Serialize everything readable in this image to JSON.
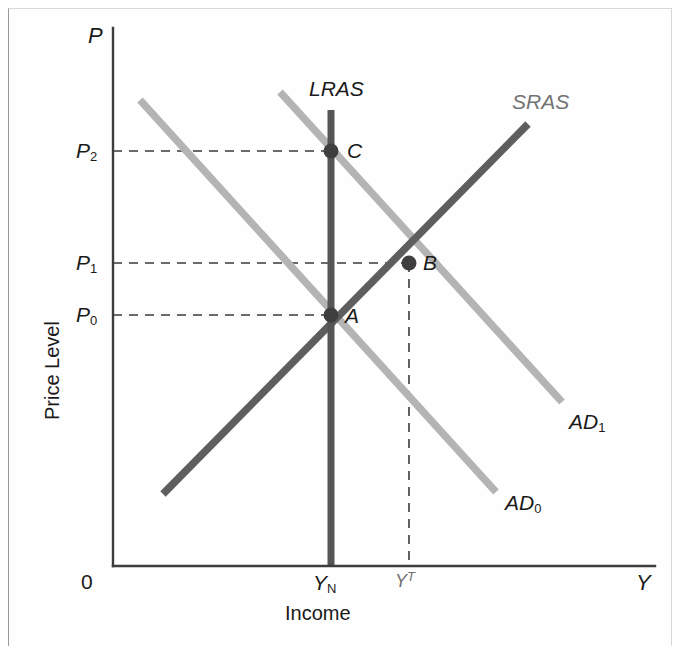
{
  "figure": {
    "kind": "ad-as-macroeconomic-diagram",
    "background": "#fefefe",
    "width": 680,
    "height": 649
  },
  "axes": {
    "y_symbol": "P",
    "y_title": "Price Level",
    "x_symbol": "Y",
    "x_title": "Income",
    "origin_label": "0",
    "y_ticks": [
      {
        "label": "P",
        "sub": "2",
        "y": 151
      },
      {
        "label": "P",
        "sub": "1",
        "y": 263
      },
      {
        "label": "P",
        "sub": "0",
        "y": 315
      }
    ],
    "x_ticks": [
      {
        "label": "Y",
        "sub": "N",
        "x": 331
      },
      {
        "label": "Y",
        "sup": "T",
        "x": 409
      }
    ]
  },
  "curves": [
    {
      "name": "AD0",
      "label": "AD",
      "sub": "0",
      "color": "#b4b4b4",
      "x1": 140,
      "y1": 100,
      "x2": 496,
      "y2": 492,
      "label_x": 505,
      "label_y": 492
    },
    {
      "name": "AD1",
      "label": "AD",
      "sub": "1",
      "color": "#b4b4b4",
      "x1": 280,
      "y1": 92,
      "x2": 562,
      "y2": 402,
      "label_x": 569,
      "label_y": 411
    },
    {
      "name": "SRAS",
      "label": "SRAS",
      "color": "#5e5e5e",
      "x1": 163,
      "y1": 494,
      "x2": 528,
      "y2": 124,
      "label_x": 512,
      "label_y": 91
    },
    {
      "name": "LRAS",
      "label": "LRAS",
      "color": "#555555",
      "x1": 331,
      "y1": 110,
      "x2": 331,
      "y2": 566,
      "label_x": 309,
      "label_y": 78
    }
  ],
  "points": [
    {
      "name": "A",
      "label": "A",
      "x": 331,
      "y": 315,
      "label_x": 345,
      "label_y": 307
    },
    {
      "name": "B",
      "label": "B",
      "x": 409,
      "y": 263,
      "label_x": 423,
      "label_y": 254
    },
    {
      "name": "C",
      "label": "C",
      "x": 331,
      "y": 151,
      "label_x": 347,
      "label_y": 142
    }
  ],
  "guides": {
    "horizontal": [
      {
        "from_price": "P2",
        "y": 151,
        "x1": 113,
        "x2": 331
      },
      {
        "from_price": "P1",
        "y": 263,
        "x1": 113,
        "x2": 409
      },
      {
        "from_price": "P0",
        "y": 315,
        "x1": 113,
        "x2": 331
      }
    ],
    "vertical": [
      {
        "from_point": "B",
        "x": 409,
        "y1": 263,
        "y2": 566
      }
    ],
    "style": "dashed",
    "color": "#3a3a3a"
  },
  "colors": {
    "axis": "#3d3d3d",
    "ad_curves": "#b4b4b4",
    "sras_curve": "#5e5e5e",
    "lras_curve": "#555555",
    "point_marker": "#3f3f3f",
    "guide_dash": "#3a3a3a",
    "frame": "#b5b5b5"
  }
}
